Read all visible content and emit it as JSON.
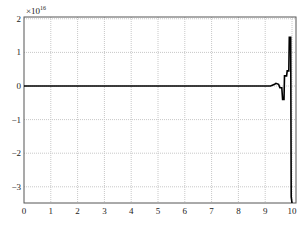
{
  "chart_data": {
    "type": "line",
    "title": "",
    "xlabel": "",
    "ylabel": "",
    "y_scale_label": "×10",
    "y_scale_exponent": "16",
    "xlim": [
      0,
      10
    ],
    "ylim": [
      -3.6,
      2
    ],
    "x_ticks": [
      "0",
      "1",
      "2",
      "3",
      "4",
      "5",
      "6",
      "7",
      "8",
      "9",
      "10"
    ],
    "y_ticks": [
      "2",
      "1",
      "0",
      "-1",
      "-2",
      "-3"
    ],
    "grid": true,
    "legend": null,
    "series": [
      {
        "name": "signal",
        "color": "#000000",
        "x": [
          0,
          9.0,
          9.2,
          9.35,
          9.4,
          9.5,
          9.55,
          9.62,
          9.65,
          9.7,
          9.72,
          9.8,
          9.82,
          9.88,
          9.9,
          9.95,
          9.97,
          10.0
        ],
        "y": [
          0,
          0,
          0.0,
          0.05,
          0.08,
          0.05,
          -0.05,
          -0.05,
          -0.4,
          -0.4,
          0.3,
          0.3,
          0.45,
          0.45,
          1.45,
          1.45,
          -3.3,
          -3.6
        ]
      }
    ]
  },
  "colors": {
    "axes": "#555555",
    "grid": "#c8c8c8",
    "line": "#000000"
  }
}
